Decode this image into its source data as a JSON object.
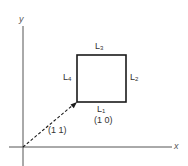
{
  "diagram": {
    "axes": {
      "x_label": "x",
      "y_label": "y"
    },
    "square": {
      "sides": [
        {
          "id": "L1",
          "base": "L",
          "sub": "1",
          "position": "bottom"
        },
        {
          "id": "L2",
          "base": "L",
          "sub": "2",
          "position": "right"
        },
        {
          "id": "L3",
          "base": "L",
          "sub": "3",
          "position": "top"
        },
        {
          "id": "L4",
          "base": "L",
          "sub": "4",
          "position": "left"
        }
      ]
    },
    "vector_label": "(1 1)",
    "corner_label": "(1 0)",
    "colors": {
      "line": "#1a1a1a",
      "axis": "#444444",
      "text": "#333333",
      "background": "#ffffff"
    }
  }
}
